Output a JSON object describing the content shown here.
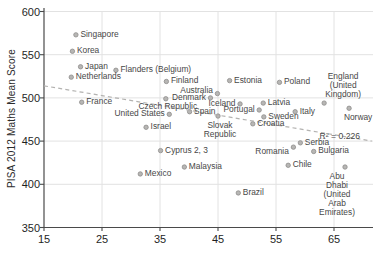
{
  "chart_data": {
    "type": "scatter",
    "title": "",
    "xlabel": "",
    "ylabel": "PISA 2012 Maths Mean Score",
    "x_ticks": [
      15,
      25,
      35,
      45,
      55,
      65
    ],
    "y_ticks": [
      350,
      400,
      450,
      500,
      550,
      600
    ],
    "xlim": [
      15,
      71.7
    ],
    "ylim": [
      350,
      600
    ],
    "grid": "on",
    "legend": "none",
    "r2_label": "R² = 0.226",
    "r2_pos": {
      "x": 66.0,
      "y": 456
    },
    "trend_line": {
      "style": "dashed",
      "x1": 15,
      "y1": 514,
      "x2": 71.5,
      "y2": 450
    },
    "points": [
      {
        "name": "singapore",
        "label": "Singapore",
        "x": 20.5,
        "y": 573,
        "pos": "right"
      },
      {
        "name": "korea",
        "label": "Korea",
        "x": 19.9,
        "y": 554,
        "pos": "right"
      },
      {
        "name": "japan",
        "label": "Japan",
        "x": 21.3,
        "y": 536,
        "pos": "right"
      },
      {
        "name": "netherlands",
        "label": "Netherlands",
        "x": 19.7,
        "y": 524,
        "pos": "right"
      },
      {
        "name": "flanders-belgium",
        "label": "Flanders (Belgium)",
        "x": 27.4,
        "y": 532,
        "pos": "right"
      },
      {
        "name": "france",
        "label": "France",
        "x": 21.5,
        "y": 495,
        "pos": "right"
      },
      {
        "name": "finland",
        "label": "Finland",
        "x": 36.1,
        "y": 519,
        "pos": "right"
      },
      {
        "name": "czech-republic",
        "label": "Czech Republic",
        "x": 36.0,
        "y": 499,
        "pos": "below",
        "dx": 2,
        "dy": -1
      },
      {
        "name": "united-states",
        "label": "United States",
        "x": 36.6,
        "y": 481,
        "pos": "left"
      },
      {
        "name": "israel",
        "label": "Israel",
        "x": 32.6,
        "y": 466,
        "pos": "right"
      },
      {
        "name": "estonia",
        "label": "Estonia",
        "x": 47.0,
        "y": 520,
        "pos": "right"
      },
      {
        "name": "australia",
        "label": "Australia",
        "x": 44.9,
        "y": 505,
        "pos": "left",
        "dy": -3
      },
      {
        "name": "denmark",
        "label": "Denmark",
        "x": 43.7,
        "y": 500,
        "pos": "left"
      },
      {
        "name": "iceland",
        "label": "Iceland",
        "x": 48.8,
        "y": 493,
        "pos": "left"
      },
      {
        "name": "spain",
        "label": "Spain",
        "x": 40.1,
        "y": 484,
        "pos": "right"
      },
      {
        "name": "slovak-republic",
        "label": "Slovak\nRepublic",
        "x": 45.0,
        "y": 479,
        "pos": "below",
        "dx": 2
      },
      {
        "name": "portugal",
        "label": "Portugal",
        "x": 52.1,
        "y": 486,
        "pos": "left"
      },
      {
        "name": "latvia",
        "label": "Latvia",
        "x": 52.8,
        "y": 494,
        "pos": "right"
      },
      {
        "name": "sweden",
        "label": "Sweden",
        "x": 52.9,
        "y": 478,
        "pos": "right"
      },
      {
        "name": "croatia",
        "label": "Croatia",
        "x": 51.0,
        "y": 470,
        "pos": "right"
      },
      {
        "name": "italy",
        "label": "Italy",
        "x": 58.3,
        "y": 484,
        "pos": "right"
      },
      {
        "name": "poland",
        "label": "Poland",
        "x": 55.6,
        "y": 518,
        "pos": "right"
      },
      {
        "name": "england-uk",
        "label": "England\n(United Kingdom)",
        "x": 63.3,
        "y": 494,
        "pos": "above",
        "dx": 19
      },
      {
        "name": "norway",
        "label": "Norway",
        "x": 67.6,
        "y": 488,
        "pos": "below",
        "dx": 9
      },
      {
        "name": "cyprus",
        "label": "Cyprus 2, 3",
        "x": 35.1,
        "y": 439,
        "pos": "right"
      },
      {
        "name": "malaysia",
        "label": "Malaysia",
        "x": 39.2,
        "y": 420,
        "pos": "right"
      },
      {
        "name": "mexico",
        "label": "Mexico",
        "x": 31.6,
        "y": 412,
        "pos": "right"
      },
      {
        "name": "brazil",
        "label": "Brazil",
        "x": 48.5,
        "y": 390,
        "pos": "right"
      },
      {
        "name": "romania",
        "label": "Romania",
        "x": 58.0,
        "y": 443,
        "pos": "left",
        "dy": 5
      },
      {
        "name": "serbia",
        "label": "Serbia",
        "x": 59.2,
        "y": 448,
        "pos": "right"
      },
      {
        "name": "bulgaria",
        "label": "Bulgaria",
        "x": 61.5,
        "y": 438,
        "pos": "right"
      },
      {
        "name": "chile",
        "label": "Chile",
        "x": 57.1,
        "y": 422,
        "pos": "right"
      },
      {
        "name": "abu-dhabi-uae",
        "label": "Abu Dhabi\n(United Arab Emirates)",
        "x": 66.9,
        "y": 420,
        "pos": "below",
        "dx": -8
      }
    ]
  },
  "colors": {
    "background": "#ffffff",
    "dot_fill": "#b7b6b4",
    "dot_border": "#8e8d8b",
    "grid": "#e2e2e2",
    "axis": "#4a4a4a",
    "trend": "#b3b2b0",
    "label_text": "#474747",
    "tick_text": "#1f1f1f"
  }
}
